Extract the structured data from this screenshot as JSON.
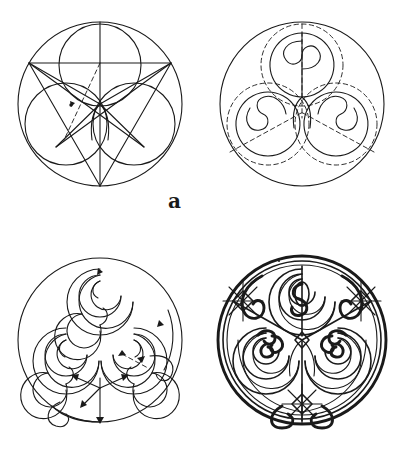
{
  "figure": {
    "background_color": "#ffffff",
    "ink_color": "#1a1a1a",
    "layout": "2x2 grid of circular diagrams",
    "width": 403,
    "height": 471
  },
  "panels": [
    {
      "id": "a",
      "label": "a",
      "caption": "Construction geometry: outer circle, three inscribed circles and star/triangle guide lines with one dashed radius",
      "line_style": "solid with one dashed construction line",
      "outer_circle": {
        "cx": 100,
        "cy": 104,
        "r": 82
      },
      "inner_circles": [
        {
          "position": "top",
          "cx": 100,
          "cy": 66,
          "r": 41
        },
        {
          "position": "bottom-left",
          "cx": 67,
          "cy": 124,
          "r": 41
        },
        {
          "position": "bottom-right",
          "cx": 133,
          "cy": 124,
          "r": 41
        }
      ],
      "guides": [
        "vertical axis",
        "horizontal chord",
        "inverted star polygon",
        "dashed radius"
      ]
    },
    {
      "id": "b",
      "label": "b",
      "caption": "Spiral placement: three S-shaped yin-yang spiral cores set in solid circles with dashed enclosing circles",
      "line_style": "solid spirals with dashed guide circles",
      "outer_circle": {
        "cx": 100,
        "cy": 104,
        "r": 82
      },
      "spiral_count": 3,
      "spiral_type": "S-curve / yin-yang double bulb",
      "rotation_symmetry": 3
    },
    {
      "id": "c",
      "label": "c",
      "caption": "Spiral development: multi-turn concentric spirals with arrowheads showing the drawing direction and joining trumpet curves",
      "line_style": "solid multi-turn spirals with direction arrows",
      "outer_circle": {
        "cx": 100,
        "cy": 104,
        "r": 82
      },
      "turns_per_spiral": 4,
      "annotations": [
        "direction arrowheads",
        "trumpet junction curves"
      ]
    },
    {
      "id": "d",
      "label": "d",
      "caption": "Finished inked ornament: heavy-weight triple spiral with trumpet junctions, lens-shaped petals and star rosettes",
      "line_style": "heavy filled linework",
      "outer_circle": {
        "cx": 100,
        "cy": 104,
        "r": 84
      },
      "rosette_count": 4,
      "turns_per_spiral": 5
    }
  ],
  "labels": {
    "a": "a",
    "b": "b",
    "c": "c",
    "d": "d"
  }
}
